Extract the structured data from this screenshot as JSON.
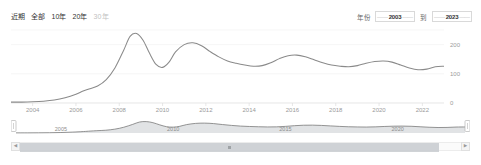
{
  "toolbar": {
    "range_tabs": [
      {
        "label": "近期",
        "active": false,
        "muted": false
      },
      {
        "label": "全部",
        "active": true,
        "muted": false
      },
      {
        "label": "10年",
        "active": false,
        "muted": false
      },
      {
        "label": "20年",
        "active": false,
        "muted": false
      },
      {
        "label": "30年",
        "active": false,
        "muted": true
      }
    ],
    "year_filter": {
      "label": "年份",
      "separator": "到",
      "from_value": "2003",
      "to_value": "2023",
      "from_placeholder": "2003",
      "to_placeholder": "2023",
      "dash_left": "——",
      "dash_right": "——"
    }
  },
  "chart_data": {
    "type": "line",
    "title": "",
    "xlabel": "",
    "ylabel": "",
    "grid": true,
    "legend_position": "none",
    "line_color": "#8a8a8a",
    "xlim": [
      2003,
      2023
    ],
    "ylim": [
      0,
      250
    ],
    "yticks": [
      0,
      100,
      200
    ],
    "ytick_labels": [
      "0",
      "100",
      "200"
    ],
    "xticks": [
      2004,
      2006,
      2008,
      2010,
      2012,
      2014,
      2016,
      2018,
      2020,
      2022
    ],
    "xtick_labels": [
      "2004",
      "2006",
      "2008",
      "2010",
      "2012",
      "2014",
      "2016",
      "2018",
      "2020",
      "2022"
    ],
    "x": [
      2003.0,
      2003.5,
      2004.0,
      2004.5,
      2005.0,
      2005.5,
      2006.0,
      2006.3,
      2006.6,
      2007.0,
      2007.4,
      2007.8,
      2008.2,
      2008.5,
      2008.8,
      2009.1,
      2009.4,
      2009.7,
      2010.0,
      2010.3,
      2010.6,
      2011.0,
      2011.4,
      2011.8,
      2012.2,
      2012.6,
      2013.0,
      2013.4,
      2013.8,
      2014.2,
      2014.6,
      2015.0,
      2015.4,
      2015.8,
      2016.2,
      2016.6,
      2017.0,
      2017.4,
      2017.8,
      2018.2,
      2018.6,
      2019.0,
      2019.4,
      2019.8,
      2020.2,
      2020.6,
      2021.0,
      2021.4,
      2021.8,
      2022.2,
      2022.6,
      2023.0
    ],
    "y": [
      3,
      3,
      4,
      6,
      10,
      18,
      30,
      40,
      48,
      58,
      80,
      120,
      180,
      228,
      238,
      215,
      170,
      132,
      122,
      140,
      175,
      200,
      206,
      196,
      176,
      158,
      144,
      136,
      130,
      126,
      128,
      138,
      152,
      162,
      164,
      158,
      148,
      138,
      130,
      126,
      124,
      128,
      136,
      142,
      144,
      140,
      130,
      120,
      114,
      116,
      124,
      126
    ]
  },
  "brush": {
    "minimap_year_labels": [
      "2005",
      "2010",
      "2015",
      "2020"
    ],
    "left_handle": "left-resize-handle",
    "right_handle": "right-resize-handle",
    "selection_start": "2003",
    "selection_end": "2023"
  },
  "scrollbar": {
    "left_arrow": "◀",
    "right_arrow": "▶"
  }
}
